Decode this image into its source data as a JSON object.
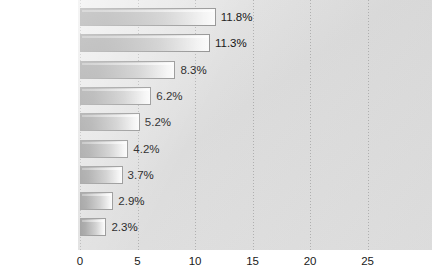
{
  "chart_data": {
    "type": "bar",
    "orientation": "horizontal",
    "title": "",
    "subtitle": "",
    "xlabel": "",
    "ylabel": "",
    "categories": [
      "Pneumonia",
      "Tuberculosis",
      "Diarrhea and\nenteritis",
      "Heart disease",
      "Liver disease",
      "Injuries",
      "Cancer",
      "Senility",
      "Diphtheria"
    ],
    "values": [
      11.8,
      11.3,
      8.3,
      6.2,
      5.2,
      4.2,
      3.7,
      2.9,
      2.3
    ],
    "data_labels": [
      "11.8%",
      "11.3%",
      "8.3%",
      "6.2%",
      "5.2%",
      "4.2%",
      "3.7%",
      "2.9%",
      "2.3%"
    ],
    "xlim": [
      0,
      30.6
    ],
    "xticks": [
      0,
      5,
      10,
      15,
      20,
      25
    ],
    "xtick_labels": [
      "0",
      "5",
      "10",
      "15",
      "20",
      "25"
    ],
    "grid": true,
    "grid_style": "dotted-vertical",
    "legend": null,
    "colors": {
      "bar_fill_start": "#8f8f8f",
      "bar_fill_end": "#fbfbfb",
      "bar_border": "#8e8e8e",
      "plot_background": "#e0e0e0",
      "label_text": "#1a1a1a",
      "page_background": "#ffffff"
    }
  }
}
